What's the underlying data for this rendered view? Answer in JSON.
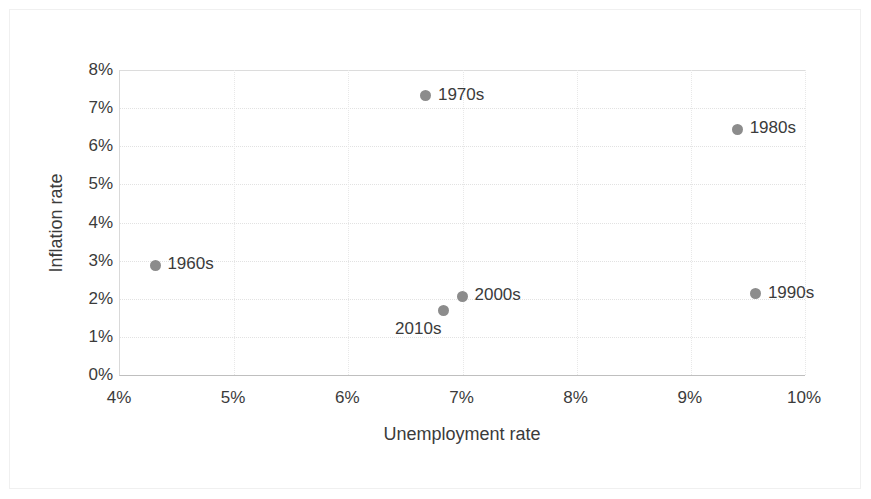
{
  "chart_data": {
    "type": "scatter",
    "title": "",
    "xlabel": "Unemployment rate",
    "ylabel": "Inflation rate",
    "xlim": [
      4,
      10
    ],
    "ylim": [
      0,
      8
    ],
    "xtick_labels": [
      "4%",
      "5%",
      "6%",
      "7%",
      "8%",
      "9%",
      "10%"
    ],
    "xticks": [
      4,
      5,
      6,
      7,
      8,
      9,
      10
    ],
    "ytick_labels": [
      "0%",
      "1%",
      "2%",
      "3%",
      "4%",
      "5%",
      "6%",
      "7%",
      "8%"
    ],
    "yticks": [
      0,
      1,
      2,
      3,
      4,
      5,
      6,
      7,
      8
    ],
    "grid": true,
    "legend": "none",
    "marker_color": "#8c8c8c",
    "points": [
      {
        "label": "1960s",
        "x": 4.31,
        "y": 2.88,
        "label_pos": "right"
      },
      {
        "label": "1970s",
        "x": 6.68,
        "y": 7.32,
        "label_pos": "right"
      },
      {
        "label": "1980s",
        "x": 9.41,
        "y": 6.44,
        "label_pos": "right"
      },
      {
        "label": "1990s",
        "x": 9.57,
        "y": 2.13,
        "label_pos": "right"
      },
      {
        "label": "2000s",
        "x": 7.0,
        "y": 2.07,
        "label_pos": "right"
      },
      {
        "label": "2010s",
        "x": 6.83,
        "y": 1.68,
        "label_pos": "below-left"
      }
    ]
  }
}
